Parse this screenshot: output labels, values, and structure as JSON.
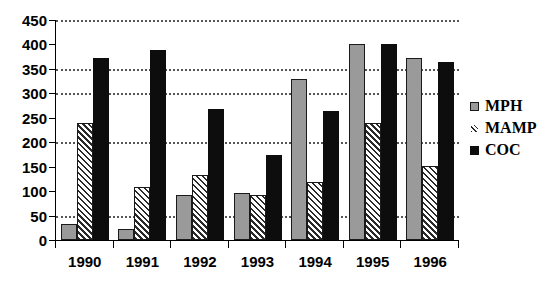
{
  "chart_data": {
    "type": "bar",
    "title": "",
    "subtitle": "",
    "xlabel": "",
    "ylabel": "",
    "categories": [
      "1990",
      "1991",
      "1992",
      "1993",
      "1994",
      "1995",
      "1996"
    ],
    "series": [
      {
        "name": "MPH",
        "values": [
          33,
          22,
          92,
          97,
          330,
          401,
          372
        ]
      },
      {
        "name": "MAMP",
        "values": [
          240,
          108,
          132,
          93,
          119,
          239,
          152
        ]
      },
      {
        "name": "COC",
        "values": [
          373,
          389,
          268,
          174,
          263,
          401,
          364
        ]
      }
    ],
    "ylim": [
      0,
      450
    ],
    "ytick_step": 50,
    "yticks": [
      0,
      50,
      100,
      150,
      200,
      250,
      300,
      350,
      400,
      450
    ],
    "ytick_labels": [
      "0",
      "50",
      "100",
      "150",
      "200",
      "250",
      "300",
      "350",
      "400",
      "450"
    ],
    "gridlines": [
      50,
      200,
      300,
      350,
      450
    ],
    "grid": true,
    "grid_style": "dotted",
    "legend_position": "right",
    "legend": [
      "MPH",
      "MAMP",
      "COC"
    ],
    "colors": {
      "MPH": "#9a9a9a",
      "MAMP": "#2a2a2a",
      "COC": "#0d0d0d",
      "axis": "#000000",
      "grid": "#555555",
      "background": "#ffffff"
    },
    "series_fill": {
      "MPH": "solid-gray",
      "MAMP": "diagonal-hatch",
      "COC": "solid-black"
    }
  }
}
